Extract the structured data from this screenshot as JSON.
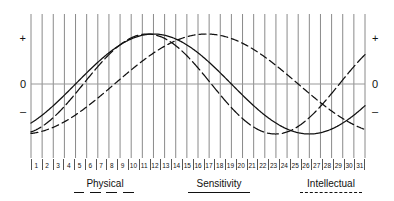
{
  "axis": {
    "left": {
      "plus": "+",
      "zero": "0",
      "minus": "–"
    },
    "right": {
      "plus": "+",
      "zero": "0",
      "minus": "–"
    }
  },
  "days": [
    "1",
    "2",
    "3",
    "4",
    "5",
    "6",
    "7",
    "8",
    "9",
    "10",
    "11",
    "12",
    "13",
    "14",
    "15",
    "16",
    "17",
    "18",
    "19",
    "20",
    "21",
    "22",
    "23",
    "24",
    "25",
    "26",
    "27",
    "28",
    "29",
    "30",
    "31"
  ],
  "legend": {
    "physical": {
      "label": "Physical",
      "style": "long-dash"
    },
    "sensitivity": {
      "label": "Sensitivity",
      "style": "solid"
    },
    "intellectual": {
      "label": "Intellectual",
      "style": "dashed"
    }
  },
  "colors": {
    "ink": "#111111",
    "gridline": "#8a8a8a",
    "zeroline": "#999999",
    "background": "#ffffff"
  },
  "chart_data": {
    "type": "line",
    "xlabel": "",
    "ylabel": "",
    "x": [
      1,
      2,
      3,
      4,
      5,
      6,
      7,
      8,
      9,
      10,
      11,
      12,
      13,
      14,
      15,
      16,
      17,
      18,
      19,
      20,
      21,
      22,
      23,
      24,
      25,
      26,
      27,
      28,
      29,
      30,
      31
    ],
    "ylim": [
      -1,
      1
    ],
    "yticks": [
      "+",
      "0",
      "–"
    ],
    "grid": true,
    "legend_position": "bottom",
    "series": [
      {
        "name": "Physical",
        "style": "long-dash",
        "period_days": 23,
        "phase_offset_days": 17.3,
        "amplitude": 1.0,
        "values": [
          0.34,
          0.6,
          0.8,
          0.94,
          1.0,
          0.98,
          0.88,
          0.71,
          0.48,
          0.22,
          -0.06,
          -0.33,
          -0.58,
          -0.79,
          -0.93,
          -1.0,
          -0.99,
          -0.9,
          -0.74,
          -0.52,
          -0.27,
          0.01,
          0.28,
          0.53,
          0.75,
          0.91,
          0.99,
          1.0,
          0.92,
          0.77,
          0.56
        ]
      },
      {
        "name": "Sensitivity",
        "style": "solid",
        "period_days": 28,
        "phase_offset_days": 23.0,
        "amplitude": 1.0,
        "values": [
          -0.78,
          -0.62,
          -0.43,
          -0.22,
          0.0,
          0.22,
          0.43,
          0.62,
          0.78,
          0.9,
          0.97,
          1.0,
          0.97,
          0.9,
          0.78,
          0.62,
          0.43,
          0.22,
          0.0,
          -0.22,
          -0.43,
          -0.62,
          -0.78,
          -0.9,
          -0.97,
          -1.0,
          -0.97,
          -0.9,
          -0.78,
          -0.62,
          -0.43
        ]
      },
      {
        "name": "Intellectual",
        "style": "dashed",
        "period_days": 33,
        "phase_offset_days": 24.5,
        "amplitude": 1.0,
        "values": [
          -0.84,
          -0.74,
          -0.62,
          -0.48,
          -0.33,
          -0.17,
          0.0,
          0.17,
          0.33,
          0.48,
          0.62,
          0.74,
          0.84,
          0.92,
          0.97,
          1.0,
          1.0,
          0.97,
          0.92,
          0.84,
          0.74,
          0.62,
          0.48,
          0.33,
          0.17,
          0.0,
          -0.17,
          -0.33,
          -0.48,
          -0.62,
          -0.74
        ]
      }
    ]
  }
}
